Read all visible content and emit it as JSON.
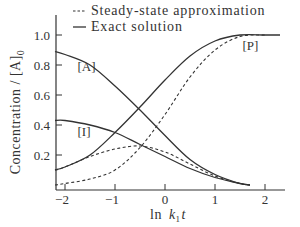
{
  "chart_data": {
    "type": "line",
    "title": "",
    "xlabel": "ln k1t",
    "xlabel_parts": {
      "main": "ln",
      "k": "k",
      "sub": "1",
      "t": "t"
    },
    "ylabel": "Concentration / [A]0",
    "ylabel_parts": {
      "main": "Concentration / [A]",
      "sub": "0"
    },
    "xlim": [
      -2.2,
      2.35
    ],
    "ylim": [
      0,
      1.1
    ],
    "xticks": [
      -2,
      -1,
      0,
      1,
      2
    ],
    "xtick_labels": [
      "−2",
      "−1",
      "0",
      "1",
      "2"
    ],
    "yticks": [
      0.2,
      0.4,
      0.6,
      0.8,
      1.0
    ],
    "ytick_labels": [
      "0.2",
      "0.4",
      "0.6",
      "0.8",
      "1.0"
    ],
    "grid": false,
    "legend": {
      "position": "top",
      "entries": [
        {
          "style": "dashed",
          "marker": "---",
          "label": "Steady-state approximation"
        },
        {
          "style": "solid",
          "marker": "—",
          "label": "Exact solution"
        }
      ]
    },
    "annotations": [
      {
        "text": "[A]",
        "x": -1.75,
        "y": 0.76
      },
      {
        "text": "[I]",
        "x": -1.75,
        "y": 0.33
      },
      {
        "text": "[P]",
        "x": 1.55,
        "y": 0.9
      }
    ],
    "series": [
      {
        "name": "[A] exact",
        "style": "solid",
        "x": [
          -2.2,
          -2.0,
          -1.5,
          -1.0,
          -0.5,
          0.0,
          0.5,
          1.0,
          1.5,
          1.7
        ],
        "values": [
          0.89,
          0.87,
          0.8,
          0.66,
          0.5,
          0.33,
          0.17,
          0.07,
          0.01,
          0.0
        ]
      },
      {
        "name": "[I] exact",
        "style": "solid",
        "x": [
          -2.2,
          -2.0,
          -1.5,
          -1.0,
          -0.5,
          0.0,
          0.5,
          1.0,
          1.5,
          1.7
        ],
        "values": [
          0.43,
          0.43,
          0.4,
          0.35,
          0.27,
          0.19,
          0.11,
          0.05,
          0.01,
          0.0
        ]
      },
      {
        "name": "[P] exact",
        "style": "solid",
        "x": [
          -2.2,
          -2.0,
          -1.5,
          -1.0,
          -0.5,
          0.0,
          0.5,
          1.0,
          1.5,
          2.0,
          2.3
        ],
        "values": [
          0.1,
          0.12,
          0.2,
          0.35,
          0.52,
          0.7,
          0.86,
          0.96,
          1.0,
          1.0,
          1.0
        ]
      },
      {
        "name": "[I] steady-state",
        "style": "dashed",
        "x": [
          -2.2,
          -2.0,
          -1.5,
          -1.0,
          -0.5,
          0.0,
          0.5,
          1.0,
          1.5,
          1.7
        ],
        "values": [
          0.1,
          0.12,
          0.19,
          0.24,
          0.26,
          0.22,
          0.14,
          0.06,
          0.01,
          0.0
        ]
      },
      {
        "name": "[P] steady-state",
        "style": "dashed",
        "x": [
          -2.2,
          -2.0,
          -1.5,
          -1.0,
          -0.5,
          0.0,
          0.5,
          1.0,
          1.5,
          2.0
        ],
        "values": [
          0.0,
          0.01,
          0.04,
          0.1,
          0.25,
          0.47,
          0.72,
          0.9,
          0.99,
          1.0
        ]
      }
    ]
  }
}
